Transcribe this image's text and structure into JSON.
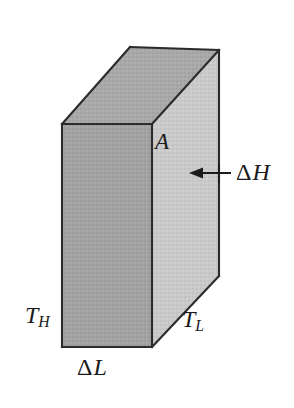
{
  "figure": {
    "name": "heat-conduction-rectangular-prism",
    "background_color": "#ffffff"
  },
  "colors": {
    "front_face": "#a2a2a2",
    "top_face": "#a8a8a8",
    "right_face": "#c9c9c9",
    "edge_stroke": "#2b2b2b",
    "label_text": "#1b1b1b",
    "arrow": "#1b1b1b"
  },
  "solid": {
    "name": "rectangular-prism",
    "front_face": {
      "name": "front-face",
      "points": "62,124 152,124 152,347 62,347"
    },
    "top_face": {
      "name": "top-face",
      "points": "62,124 130,47 219,50 152,124"
    },
    "right_face": {
      "name": "right-face",
      "points": "152,124 219,50 219,276 152,347"
    },
    "edges": [
      {
        "name": "front-top-edge",
        "x1": 62,
        "y1": 124,
        "x2": 152,
        "y2": 124
      },
      {
        "name": "front-left-edge",
        "x1": 62,
        "y1": 124,
        "x2": 62,
        "y2": 347
      },
      {
        "name": "front-bottom-edge",
        "x1": 62,
        "y1": 347,
        "x2": 152,
        "y2": 347
      },
      {
        "name": "front-right-vertical-edge",
        "x1": 152,
        "y1": 124,
        "x2": 152,
        "y2": 347
      },
      {
        "name": "top-left-diagonal-edge",
        "x1": 62,
        "y1": 124,
        "x2": 130,
        "y2": 47
      },
      {
        "name": "top-back-edge",
        "x1": 130,
        "y1": 47,
        "x2": 219,
        "y2": 50
      },
      {
        "name": "top-right-diagonal-edge",
        "x1": 152,
        "y1": 124,
        "x2": 219,
        "y2": 50
      },
      {
        "name": "back-right-vertical-edge",
        "x1": 219,
        "y1": 50,
        "x2": 219,
        "y2": 276
      },
      {
        "name": "bottom-right-diagonal-edge",
        "x1": 152,
        "y1": 347,
        "x2": 219,
        "y2": 276
      }
    ]
  },
  "arrow": {
    "name": "delta-h-arrow",
    "points_to": "left",
    "tail_x": 231,
    "tail_y": 173,
    "head_x": 191,
    "head_y": 173,
    "tick_x": 219,
    "tick_top_y": 163,
    "tick_bottom_y": 183
  },
  "labels": {
    "area": {
      "name": "area-label",
      "text": "A",
      "meaning": "cross-sectional area"
    },
    "delta_h": {
      "symbol": "Δ",
      "variable": "H",
      "meaning": "thickness / height increment"
    },
    "temp_hot": {
      "variable": "T",
      "subscript": "H",
      "meaning": "hot-side temperature"
    },
    "temp_cold": {
      "variable": "T",
      "subscript": "L",
      "meaning": "cold-side temperature"
    },
    "delta_l": {
      "symbol": "Δ",
      "variable": "L",
      "meaning": "length increment"
    }
  }
}
